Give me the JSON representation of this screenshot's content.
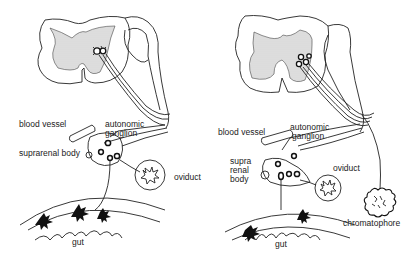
{
  "diagram": {
    "panels": [
      {
        "id": "left",
        "labels": {
          "blood_vessel": "blood vessel",
          "autonomic_ganglion_1": "autonomic",
          "autonomic_ganglion_2": "ganglion",
          "suprarenal_body": "suprarenal body",
          "oviduct": "oviduct",
          "gut": "gut"
        }
      },
      {
        "id": "right",
        "labels": {
          "blood_vessel": "blood vessel",
          "autonomic_ganglion_1": "autonomic",
          "autonomic_ganglion_2": "ganglion",
          "suprarenal_1": "supra",
          "suprarenal_2": "renal",
          "suprarenal_3": "body",
          "oviduct": "oviduct",
          "chromatophore": "chromatophore",
          "gut": "gut"
        }
      }
    ],
    "colors": {
      "line": "#222222",
      "grey_matter": "#d8d8d8",
      "background": "#ffffff"
    }
  }
}
